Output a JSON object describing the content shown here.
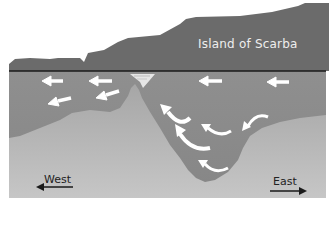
{
  "diagram": {
    "labels": {
      "island": "Island of Scarba",
      "west": "West",
      "east": "East"
    },
    "colors": {
      "background": "#ffffff",
      "land": "#6b6b6b",
      "water_line": "#1a1a1a",
      "water": "#8c8c8c",
      "seabed_top": "#a9a9a9",
      "seabed_bottom": "#c4c4c4",
      "flow_arrow": "#ffffff",
      "direction_arrow": "#1a1a1a",
      "whirlpool": "#e6e6e6"
    },
    "flow_arrows": [
      {
        "kind": "straight-left",
        "x": 50,
        "y": 81
      },
      {
        "kind": "straight-left",
        "x": 98,
        "y": 81
      },
      {
        "kind": "straight-left",
        "x": 210,
        "y": 81
      },
      {
        "kind": "straight-left",
        "x": 278,
        "y": 81
      },
      {
        "kind": "diagonal-left",
        "x": 110,
        "y": 95
      },
      {
        "kind": "diagonal-left",
        "x": 60,
        "y": 101
      },
      {
        "kind": "curl",
        "x": 175,
        "y": 110
      },
      {
        "kind": "curl",
        "x": 185,
        "y": 135
      },
      {
        "kind": "curl",
        "x": 213,
        "y": 130
      },
      {
        "kind": "curl",
        "x": 250,
        "y": 118
      },
      {
        "kind": "curl",
        "x": 210,
        "y": 168
      }
    ],
    "features": [
      "whirlpool",
      "pinnacle",
      "deep-trench"
    ]
  }
}
